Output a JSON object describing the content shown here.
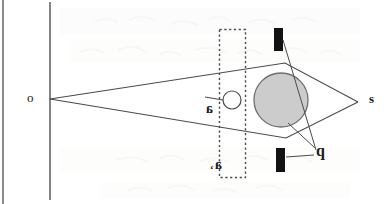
{
  "figure": {
    "background_color": "#ffffff",
    "ink_color": "#3a3a3a",
    "labels": {
      "source_point": "o",
      "image_point": "s",
      "aperture_marker": "q",
      "object_upper": "a",
      "object_lower": "a",
      "object_lower_prime": "‘"
    },
    "elements": {
      "page_edge_label": "page-edge-line",
      "screen_label": "vertical-screen-line",
      "dashed_box_label": "dashed-aperture-box",
      "shaded_disk_label": "shaded-disk",
      "small_circle_label": "small-open-circle",
      "bar_top_label": "black-bar-top",
      "bar_bottom_label": "black-bar-bottom"
    },
    "colors": {
      "disk_fill": "#cccccc",
      "disk_stroke": "#6f6f6f",
      "bar_fill": "#121212",
      "line": "#4a4a4a",
      "dash": "#4a4a4a",
      "ghost_text": "#ececea"
    },
    "geometry": {
      "left_apex": [
        50,
        99
      ],
      "right_apex": [
        358,
        102
      ],
      "cone_upper_peak": [
        285,
        63
      ],
      "cone_lower_peak": [
        286,
        138
      ],
      "disk_center": [
        281,
        100
      ],
      "disk_radius": 27,
      "small_circle_center": [
        232,
        100
      ],
      "small_circle_radius": 9,
      "dashed_box": [
        219,
        29,
        26,
        148
      ],
      "bar_top": [
        274,
        28,
        9,
        23
      ],
      "bar_bottom": [
        276,
        148,
        9,
        24
      ],
      "screen_line_x": 50,
      "page_edge_x": 3
    }
  },
  "ghost_text": {
    "line1": "          ",
    "line2": "    ",
    "line3": " "
  }
}
